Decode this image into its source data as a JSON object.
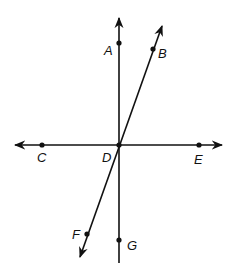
{
  "diagram": {
    "type": "intersecting-lines",
    "colors": {
      "line": "#111111",
      "background": "#ffffff"
    },
    "lines": [
      {
        "name": "vertical-line",
        "through": [
          "A",
          "D",
          "G"
        ],
        "arrow_top": true,
        "arrow_bottom": false
      },
      {
        "name": "horizontal-line",
        "through": [
          "C",
          "D",
          "E"
        ],
        "arrow_left": true,
        "arrow_right": true
      },
      {
        "name": "slanted-line",
        "through": [
          "B",
          "D",
          "F"
        ],
        "arrow_top": true,
        "arrow_bottom": true
      }
    ],
    "points": {
      "A": {
        "label": "A"
      },
      "B": {
        "label": "B"
      },
      "C": {
        "label": "C"
      },
      "D": {
        "label": "D"
      },
      "E": {
        "label": "E"
      },
      "F": {
        "label": "F"
      },
      "G": {
        "label": "G"
      }
    }
  }
}
